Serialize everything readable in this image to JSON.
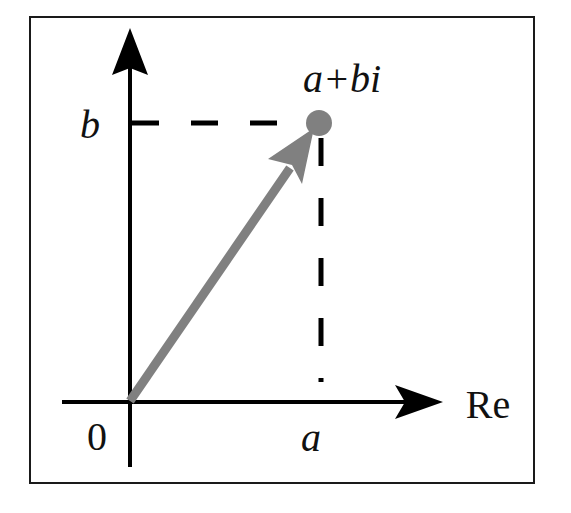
{
  "diagram": {
    "labels": {
      "point": "a+bi",
      "imag_tick": "b",
      "real_tick": "a",
      "origin": "0",
      "real_axis": "Re"
    },
    "colors": {
      "axes": "#000000",
      "vector": "#808080",
      "dashes": "#000000",
      "frame": "#000000",
      "background": "#ffffff"
    },
    "elements": {
      "frame": "rectangle border",
      "vertical_axis": "imaginary axis with arrow (unlabeled)",
      "horizontal_axis": "real axis with arrow",
      "vector": "gray arrow from origin to point",
      "point": "gray filled circle at (a, b)",
      "projection_lines": "black dashed lines to axes"
    }
  }
}
